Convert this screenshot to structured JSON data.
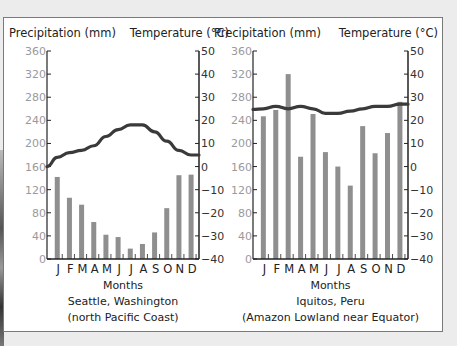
{
  "chart_data": [
    {
      "type": "bar+line",
      "title": "Seattle, Washington",
      "subtitle": "(north Pacific Coast)",
      "xlabel": "Months",
      "ylabel_left": "Precipitation (mm)",
      "ylabel_right": "Temperature (°C)",
      "categories": [
        "J",
        "F",
        "M",
        "A",
        "M",
        "J",
        "J",
        "A",
        "S",
        "O",
        "N",
        "D"
      ],
      "precip_ylim": [
        0,
        360
      ],
      "precip_ticks": [
        0,
        40,
        80,
        120,
        160,
        200,
        240,
        280,
        320,
        360
      ],
      "temp_ylim": [
        -40,
        50
      ],
      "temp_ticks": [
        -40,
        -30,
        -20,
        -10,
        0,
        10,
        20,
        30,
        40,
        50
      ],
      "series": [
        {
          "name": "Precipitation (mm)",
          "type": "bar",
          "values": [
            142,
            106,
            94,
            64,
            42,
            38,
            18,
            26,
            46,
            88,
            145,
            146
          ]
        },
        {
          "name": "Temperature (°C)",
          "type": "line",
          "values": [
            4,
            6,
            7,
            9,
            13,
            16,
            18,
            18,
            15,
            11,
            7,
            5
          ]
        }
      ]
    },
    {
      "type": "bar+line",
      "title": "Iquitos, Peru",
      "subtitle": "(Amazon Lowland near Equator)",
      "xlabel": "Months",
      "ylabel_left": "Precipitation (mm)",
      "ylabel_right": "Temperature (°C)",
      "categories": [
        "J",
        "F",
        "M",
        "A",
        "M",
        "J",
        "J",
        "A",
        "S",
        "O",
        "N",
        "D"
      ],
      "precip_ylim": [
        0,
        360
      ],
      "precip_ticks": [
        0,
        40,
        80,
        120,
        160,
        200,
        240,
        280,
        320,
        360
      ],
      "temp_ylim": [
        -40,
        50
      ],
      "temp_ticks": [
        -40,
        -30,
        -20,
        -10,
        0,
        10,
        20,
        30,
        40,
        50
      ],
      "series": [
        {
          "name": "Precipitation (mm)",
          "type": "bar",
          "values": [
            247,
            258,
            320,
            177,
            251,
            185,
            160,
            127,
            230,
            183,
            218,
            272
          ]
        },
        {
          "name": "Temperature (°C)",
          "type": "line",
          "values": [
            25,
            26,
            25,
            26,
            25,
            23,
            23,
            24,
            25,
            26,
            26,
            27
          ]
        }
      ]
    }
  ],
  "colors": {
    "bar": "#8f8f8f",
    "line": "#3a3a3a",
    "axis": "#222222",
    "precip_tick_text": "#9a9a9a",
    "temp_tick_text": "#333333"
  }
}
